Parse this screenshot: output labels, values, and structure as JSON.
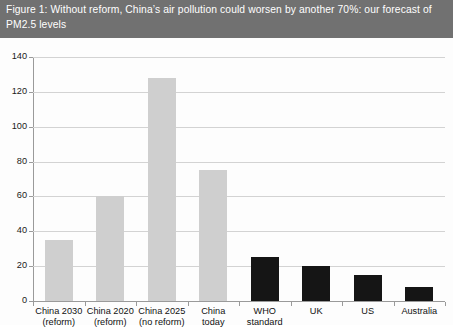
{
  "figure": {
    "title": "Figure 1: Without reform, China’s air pollution could worsen by another 70%: our forecast of PM2.5 levels",
    "title_background_color": "#717171",
    "title_text_color": "#ffffff"
  },
  "chart_data": {
    "type": "bar",
    "title": "Figure 1: Without reform, China’s air pollution could worsen by another 70%: our forecast of PM2.5 levels",
    "xlabel": "",
    "ylabel": "",
    "ylim": [
      0,
      140
    ],
    "ytick_step": 20,
    "yticks": [
      "0",
      "20",
      "40",
      "60",
      "80",
      "100",
      "120",
      "140"
    ],
    "grid": "horizontal",
    "legend": "none",
    "categories": [
      "China 2030 (reform)",
      "China 2020 (reform)",
      "China 2025 (no reform)",
      "China today",
      "WHO standard",
      "UK",
      "US",
      "Australia"
    ],
    "category_lines": [
      [
        "China 2030",
        "(reform)"
      ],
      [
        "China 2020",
        "(reform)"
      ],
      [
        "China 2025",
        "(no reform)"
      ],
      [
        "China",
        "today"
      ],
      [
        "WHO",
        "standard"
      ],
      [
        "UK",
        ""
      ],
      [
        "US",
        ""
      ],
      [
        "Australia",
        ""
      ]
    ],
    "values": [
      35,
      60,
      128,
      75,
      25,
      20,
      15,
      8
    ],
    "bar_colors": [
      "#cfcfcf",
      "#cfcfcf",
      "#cfcfcf",
      "#cfcfcf",
      "#151515",
      "#151515",
      "#151515",
      "#151515"
    ],
    "series": [
      {
        "name": "PM2.5 level",
        "values": [
          35,
          60,
          128,
          75,
          25,
          20,
          15,
          8
        ]
      }
    ]
  },
  "colors": {
    "grey_bar": "#cfcfcf",
    "black_bar": "#151515",
    "gridline": "#d3d3d3",
    "axis": "#9a9a9a",
    "banner": "#717171"
  }
}
